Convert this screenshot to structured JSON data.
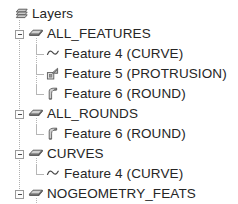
{
  "panel": {
    "title": "Layers",
    "background_color": "#ffffff",
    "text_color": "#262626",
    "tree_line_color": "#b6b6b6"
  },
  "tree": {
    "root": {
      "label": "Layers",
      "icon": "layers-stack-icon",
      "expanded": true
    },
    "groups": [
      {
        "label": "ALL_FEATURES",
        "icon": "layer-icon",
        "expander": "minus",
        "expanded": true,
        "children": [
          {
            "label": "Feature 4 (CURVE)",
            "icon": "curve-icon"
          },
          {
            "label": "Feature 5 (PROTRUSION)",
            "icon": "protrusion-icon"
          },
          {
            "label": "Feature 6 (ROUND)",
            "icon": "round-icon"
          }
        ]
      },
      {
        "label": "ALL_ROUNDS",
        "icon": "layer-icon",
        "expander": "minus",
        "expanded": true,
        "children": [
          {
            "label": "Feature 6 (ROUND)",
            "icon": "round-icon"
          }
        ]
      },
      {
        "label": "CURVES",
        "icon": "layer-icon",
        "expander": "minus",
        "expanded": true,
        "children": [
          {
            "label": "Feature 4 (CURVE)",
            "icon": "curve-icon"
          }
        ]
      },
      {
        "label": "NOGEOMETRY_FEATS",
        "icon": "layer-icon",
        "expander": "minus",
        "expanded": true,
        "children": [
          {
            "label": "Feature 4 (CURVE)",
            "icon": "curve-icon"
          }
        ]
      }
    ]
  }
}
